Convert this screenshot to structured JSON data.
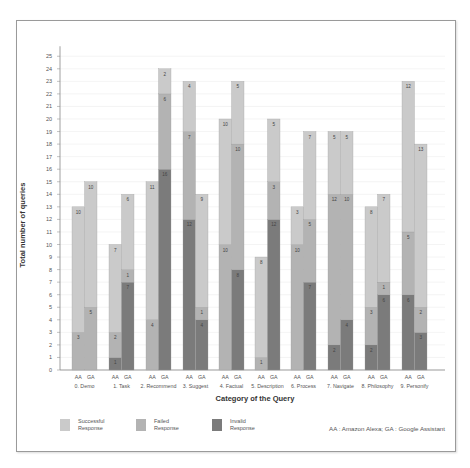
{
  "chart_data": {
    "type": "bar",
    "stacked": true,
    "grouped": true,
    "title": "",
    "xlabel": "Category of the Query",
    "ylabel": "Total number of queries",
    "ylim": [
      0,
      25
    ],
    "yticks": [
      0,
      1,
      2,
      3,
      4,
      5,
      6,
      7,
      8,
      9,
      10,
      11,
      12,
      13,
      14,
      15,
      16,
      17,
      18,
      19,
      20,
      21,
      22,
      23,
      24,
      25
    ],
    "grid": true,
    "legend_position": "bottom-left",
    "categories": [
      "0. Demo",
      "1. Task",
      "2. Recommend",
      "3. Suggest",
      "4. Factual",
      "5. Description",
      "6. Process",
      "7. Navigate",
      "8. Philosophy",
      "9. Personify"
    ],
    "subgroups": [
      "AA",
      "GA"
    ],
    "series": [
      {
        "name": "Invalid Response",
        "color": "#7b7b7b",
        "AA": [
          0,
          1,
          0,
          12,
          0,
          0,
          0,
          2,
          2,
          6
        ],
        "GA": [
          0,
          7,
          16,
          4,
          8,
          12,
          7,
          4,
          6,
          3
        ]
      },
      {
        "name": "Failed Response",
        "color": "#b3b3b3",
        "AA": [
          3,
          2,
          4,
          7,
          10,
          1,
          10,
          12,
          3,
          5
        ],
        "GA": [
          5,
          1,
          6,
          1,
          10,
          3,
          5,
          10,
          1,
          2
        ]
      },
      {
        "name": "Successful Response",
        "color": "#cacaca",
        "AA": [
          10,
          7,
          11,
          4,
          10,
          8,
          3,
          5,
          8,
          12
        ],
        "GA": [
          10,
          6,
          2,
          9,
          5,
          5,
          7,
          5,
          7,
          13
        ]
      }
    ],
    "totals": {
      "AA": [
        13,
        10,
        15,
        23,
        20,
        9,
        13,
        19,
        13,
        23
      ],
      "GA": [
        15,
        14,
        24,
        14,
        23,
        20,
        19,
        19,
        14,
        18
      ]
    },
    "annotations": [
      "AA : Amazon Alexa; GA : Google Assistant"
    ]
  },
  "legend": {
    "items": [
      {
        "label_line1": "Successful",
        "label_line2": "Response",
        "color": "#cacaca"
      },
      {
        "label_line1": "Failed",
        "label_line2": "Response",
        "color": "#b3b3b3"
      },
      {
        "label_line1": "Invalid",
        "label_line2": "Response",
        "color": "#7b7b7b"
      }
    ]
  },
  "footnote": "AA : Amazon Alexa; GA : Google Assistant"
}
